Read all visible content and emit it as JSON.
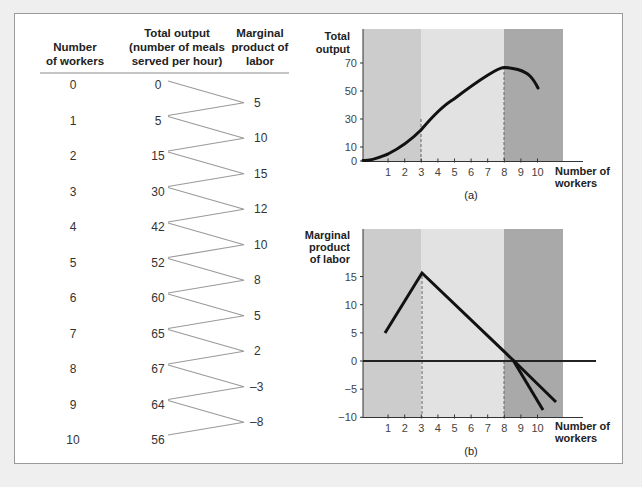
{
  "table": {
    "headers": {
      "workers": [
        "Number",
        "of workers"
      ],
      "output": [
        "Total output",
        "(number of meals",
        "served per hour)"
      ],
      "mpl": [
        "Marginal",
        "product of",
        "labor"
      ]
    },
    "workers": [
      "0",
      "1",
      "2",
      "3",
      "4",
      "5",
      "6",
      "7",
      "8",
      "9",
      "10"
    ],
    "total_output": [
      "0",
      "5",
      "15",
      "30",
      "42",
      "52",
      "60",
      "65",
      "67",
      "64",
      "56"
    ],
    "marginal_product": [
      "5",
      "10",
      "15",
      "12",
      "10",
      "8",
      "5",
      "2",
      "-3",
      "-8"
    ]
  },
  "chart_data": [
    {
      "type": "line",
      "panel_label": "(a)",
      "title": "",
      "xlabel": "Number of workers",
      "ylabel": "Total output",
      "x": [
        0,
        1,
        2,
        3,
        4,
        5,
        6,
        7,
        8,
        9,
        10
      ],
      "values": [
        0,
        5,
        15,
        30,
        42,
        52,
        60,
        65,
        67,
        64,
        56
      ],
      "x_ticks": [
        "1",
        "2",
        "3",
        "4",
        "5",
        "6",
        "7",
        "8",
        "9",
        "10"
      ],
      "y_ticks": [
        "0",
        "10",
        "30",
        "50",
        "70"
      ],
      "ylim": [
        0,
        90
      ],
      "xlim": [
        0,
        12
      ],
      "shaded_regions": [
        {
          "from": 0,
          "to": 3,
          "color": "#cccccc"
        },
        {
          "from": 3,
          "to": 8,
          "color": "#e2e2e2"
        },
        {
          "from": 8,
          "to": 11.5,
          "color": "#a9a9a9"
        }
      ],
      "dashed_verticals": [
        3,
        8
      ],
      "grid": false
    },
    {
      "type": "line",
      "panel_label": "(b)",
      "title": "",
      "xlabel": "Number of workers",
      "ylabel": "Marginal product of labor",
      "series": [
        {
          "name": "MPL (left branch)",
          "x": [
            1,
            3
          ],
          "values": [
            5,
            15.5
          ]
        },
        {
          "name": "MPL (shallow decline)",
          "x": [
            3,
            8.5,
            11.1
          ],
          "values": [
            15.5,
            0,
            -7.2
          ]
        },
        {
          "name": "MPL (steep decline)",
          "x": [
            8.5,
            10.3
          ],
          "values": [
            0,
            -8.7
          ]
        }
      ],
      "x_ticks": [
        "1",
        "2",
        "3",
        "4",
        "5",
        "6",
        "7",
        "8",
        "9",
        "10"
      ],
      "y_ticks": [
        "-10",
        "-5",
        "0",
        "5",
        "10",
        "15"
      ],
      "ylim": [
        -10,
        20
      ],
      "xlim": [
        0,
        12
      ],
      "shaded_regions": [
        {
          "from": 0,
          "to": 3,
          "color": "#cccccc"
        },
        {
          "from": 3,
          "to": 8,
          "color": "#e2e2e2"
        },
        {
          "from": 8,
          "to": 11.5,
          "color": "#a9a9a9"
        }
      ],
      "dashed_verticals": [
        3,
        8
      ],
      "zero_line": true,
      "grid": false
    }
  ],
  "labels": {
    "a_y1": "Total",
    "a_y2": "output",
    "b_y1": "Marginal",
    "b_y2": "product",
    "b_y3": "of labor",
    "x1": "Number of",
    "x2": "workers",
    "a_panel": "(a)",
    "b_panel": "(b)"
  }
}
